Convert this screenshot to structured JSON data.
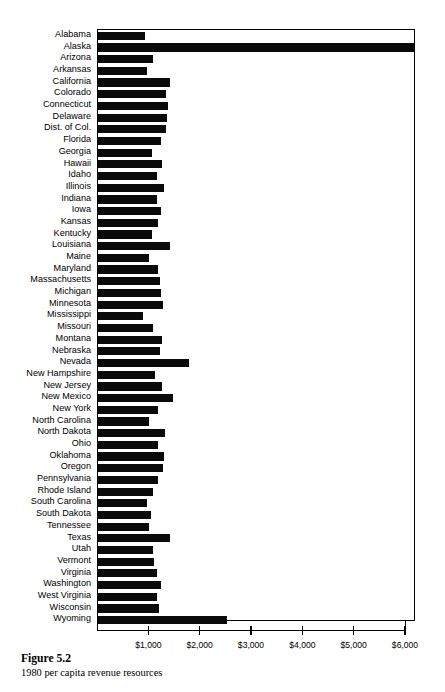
{
  "figure": {
    "caption_title": "Figure 5.2",
    "caption_subtitle": "1980 per capita revenue resources"
  },
  "axis": {
    "tick_labels": [
      "$1,000",
      "$2,000",
      "$3,000",
      "$4,000",
      "$5,000",
      "$6,000"
    ],
    "tick_values": [
      1000,
      2000,
      3000,
      4000,
      5000,
      6000
    ]
  },
  "chart_data": {
    "type": "bar",
    "orientation": "horizontal",
    "title": "Figure 5.2",
    "subtitle": "1980 per capita revenue resources",
    "xlabel": "",
    "ylabel": "",
    "xlim": [
      0,
      6210
    ],
    "grid": false,
    "legend": false,
    "bar_color": "#0a0a0a",
    "tick_values": [
      1000,
      2000,
      3000,
      4000,
      5000,
      6000
    ],
    "tick_labels": [
      "$1,000",
      "$2,000",
      "$3,000",
      "$4,000",
      "$5,000",
      "$6,000"
    ],
    "categories": [
      "Alabama",
      "Alaska",
      "Arizona",
      "Arkansas",
      "California",
      "Colorado",
      "Connecticut",
      "Delaware",
      "Dist. of Col.",
      "Florida",
      "Georgia",
      "Hawaii",
      "Idaho",
      "Illinois",
      "Indiana",
      "Iowa",
      "Kansas",
      "Kentucky",
      "Louisiana",
      "Maine",
      "Maryland",
      "Massachusetts",
      "Michigan",
      "Minnesota",
      "Mississippi",
      "Missouri",
      "Montana",
      "Nebraska",
      "Nevada",
      "New Hampshire",
      "New Jersey",
      "New Mexico",
      "New York",
      "North Carolina",
      "North Dakota",
      "Ohio",
      "Oklahoma",
      "Oregon",
      "Pennsylvania",
      "Rhode Island",
      "South Carolina",
      "South Dakota",
      "Tennessee",
      "Texas",
      "Utah",
      "Vermont",
      "Virginia",
      "Washington",
      "West Virginia",
      "Wisconsin",
      "Wyoming"
    ],
    "values": [
      910,
      6150,
      1070,
      950,
      1400,
      1330,
      1360,
      1340,
      1330,
      1230,
      1060,
      1250,
      1140,
      1290,
      1140,
      1230,
      1170,
      1060,
      1410,
      1000,
      1160,
      1200,
      1220,
      1270,
      870,
      1080,
      1250,
      1200,
      1780,
      1120,
      1240,
      1460,
      1160,
      1000,
      1300,
      1170,
      1290,
      1260,
      1160,
      1080,
      960,
      1030,
      1000,
      1400,
      1070,
      1090,
      1150,
      1220,
      1150,
      1190,
      2520
    ]
  }
}
